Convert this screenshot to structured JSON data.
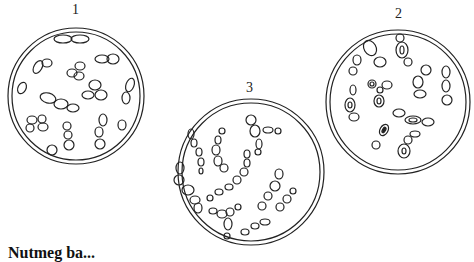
{
  "figure": {
    "panels": [
      {
        "label": "1",
        "description": "budding yeast cells, simple clusters"
      },
      {
        "label": "2",
        "description": "budding yeast cells, some with inner vacuoles"
      },
      {
        "label": "3",
        "description": "chains of cells with inner vacuoles"
      }
    ],
    "caption_partial": "Nutmeg ba..."
  },
  "colors": {
    "stroke": "#222222",
    "background": "#ffffff"
  }
}
